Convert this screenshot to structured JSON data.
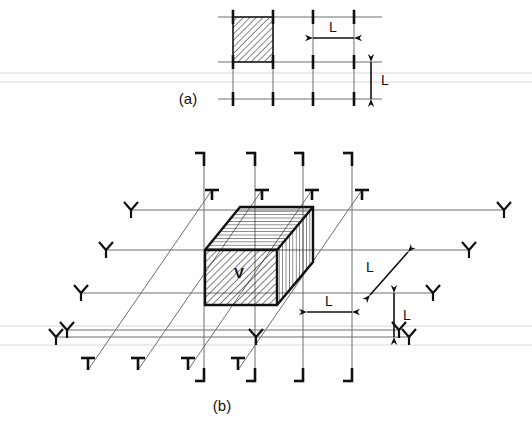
{
  "figure": {
    "background_color": "#ffffff",
    "ink_color": "#111111",
    "gridline_color": "#6f6f6f",
    "panels": [
      {
        "id": "a",
        "caption": "(a)",
        "description": "Two-dimensional square grid of spacing L with one shaded (hatched) unit square at the upper-left.",
        "dimension_labels": [
          "L",
          "L"
        ],
        "hatched_cell_label": ""
      },
      {
        "id": "b",
        "caption": "(b)",
        "description": "Three-dimensional isometric grid of spacing L containing one hatched rectangular volume element labelled V.",
        "dimension_labels": [
          "L",
          "L",
          "L"
        ],
        "volume_label": "V"
      }
    ]
  },
  "panel_a": {
    "caption": "(a)",
    "dim_horizontal_label": "L",
    "dim_vertical_label": "L",
    "cell_spacing": "L",
    "grid": {
      "vertical_x": [
        233,
        273,
        313,
        354
      ],
      "horizontal_y": [
        17,
        62,
        99
      ],
      "x_start": 218,
      "x_end": 382,
      "y_start": 9,
      "y_end": 104
    },
    "hatched_cell": {
      "x": 233,
      "y": 17,
      "width": 40,
      "height": 45
    },
    "dim_horizontal": {
      "x1": 313,
      "x2": 354,
      "y": 38,
      "label": "L"
    },
    "dim_vertical": {
      "x": 371,
      "y1": 62,
      "y2": 99,
      "label": "L"
    }
  },
  "panel_b": {
    "caption": "(b)",
    "volume_label": "V",
    "dim_diagonal_label": "L",
    "dim_horizontal_label": "L",
    "dim_vertical_label": "L",
    "grid": {
      "vertical_x": [
        204,
        255,
        303,
        352
      ],
      "vertical_y_top": 152,
      "vertical_y_bottom": 382,
      "horizontal_y": [
        210,
        250,
        293,
        330,
        337
      ],
      "diagonal_count": 4
    },
    "block": {
      "front_face_hatch": "diagonal",
      "top_face_hatch": "horizontal",
      "right_face_hatch": "vertical",
      "label": "V"
    },
    "dim_diagonal": {
      "label": "L"
    },
    "dim_horizontal": {
      "x1": 307,
      "x2": 352,
      "y": 312,
      "label": "L"
    },
    "dim_vertical": {
      "x": 394,
      "y1": 293,
      "y2": 337,
      "label": "L"
    }
  }
}
